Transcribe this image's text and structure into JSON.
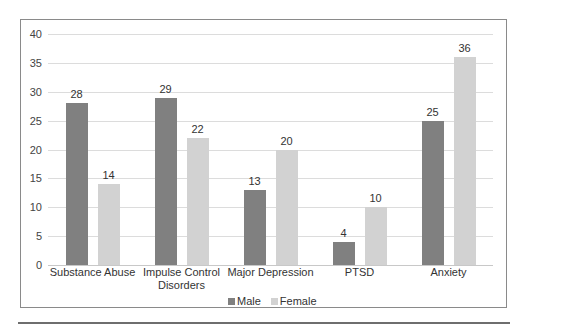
{
  "chart_data": {
    "type": "bar",
    "title": "",
    "xlabel": "",
    "ylabel": "",
    "ylim": [
      0,
      40
    ],
    "yticks": [
      0,
      5,
      10,
      15,
      20,
      25,
      30,
      35,
      40
    ],
    "grid": true,
    "legend_position": "bottom",
    "categories": [
      "Substance Abuse",
      "Impulse Control Disorders",
      "Major Depression",
      "PTSD",
      "Anxiety"
    ],
    "series": [
      {
        "name": "Male",
        "color": "#808080",
        "values": [
          28,
          29,
          13,
          4,
          25
        ]
      },
      {
        "name": "Female",
        "color": "#d2d2d2",
        "values": [
          14,
          22,
          20,
          10,
          36
        ]
      }
    ]
  },
  "labels": {
    "yticks": [
      "0",
      "5",
      "10",
      "15",
      "20",
      "25",
      "30",
      "35",
      "40"
    ],
    "categories": [
      "Substance Abuse",
      "Impulse Control\nDisorders",
      "Major Depression",
      "PTSD",
      "Anxiety"
    ],
    "male": [
      "28",
      "29",
      "13",
      "4",
      "25"
    ],
    "female": [
      "14",
      "22",
      "20",
      "10",
      "36"
    ],
    "legend": [
      "Male",
      "Female"
    ]
  }
}
